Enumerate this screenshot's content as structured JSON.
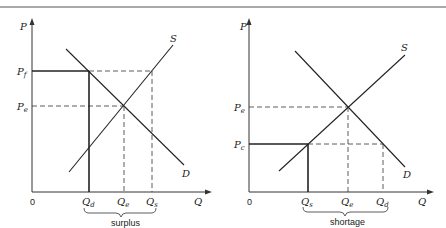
{
  "figure": {
    "top_rule": true,
    "panels": [
      {
        "id": "surplus",
        "axis_y_label": "P",
        "axis_x_label": "Q",
        "origin_label": "0",
        "supply_label": "S",
        "demand_label": "D",
        "price_labels": [
          {
            "main": "P",
            "sub": "f"
          },
          {
            "main": "P",
            "sub": "e"
          }
        ],
        "quantity_labels": [
          {
            "main": "Q",
            "sub": "d"
          },
          {
            "main": "Q",
            "sub": "e"
          },
          {
            "main": "Q",
            "sub": "s"
          }
        ],
        "brace_label": "surplus"
      },
      {
        "id": "shortage",
        "axis_y_label": "P",
        "axis_x_label": "Q",
        "origin_label": "0",
        "supply_label": "S",
        "demand_label": "D",
        "price_labels": [
          {
            "main": "P",
            "sub": "e"
          },
          {
            "main": "P",
            "sub": "c"
          }
        ],
        "quantity_labels": [
          {
            "main": "Q",
            "sub": "s"
          },
          {
            "main": "Q",
            "sub": "e"
          },
          {
            "main": "Q",
            "sub": "d"
          }
        ],
        "brace_label": "shortage"
      }
    ]
  }
}
